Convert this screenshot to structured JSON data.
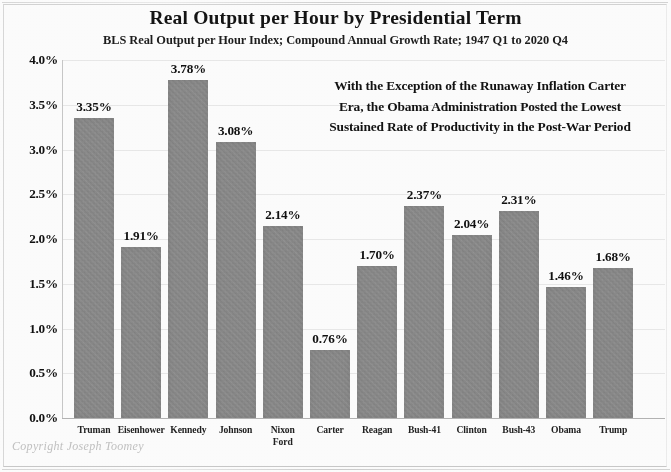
{
  "chart_data": {
    "type": "bar",
    "title": "Real Output per Hour by Presidential Term",
    "subtitle": "BLS Real Output per Hour Index; Compound Annual Growth Rate; 1947 Q1 to 2020 Q4",
    "xlabel": "",
    "ylabel": "",
    "ylim": [
      0,
      4.0
    ],
    "grid": true,
    "legend": "none",
    "categories": [
      "Truman",
      "Eisenhower",
      "Kennedy",
      "Johnson",
      "Nixon\nFord",
      "Carter",
      "Reagan",
      "Bush-41",
      "Clinton",
      "Bush-43",
      "Obama",
      "Trump"
    ],
    "values": [
      3.35,
      1.91,
      3.78,
      3.08,
      2.14,
      0.76,
      1.7,
      2.37,
      2.04,
      2.31,
      1.46,
      1.68
    ],
    "value_labels": [
      "3.35%",
      "1.91%",
      "3.78%",
      "3.08%",
      "2.14%",
      "0.76%",
      "1.70%",
      "2.37%",
      "2.04%",
      "2.31%",
      "1.46%",
      "1.68%"
    ],
    "ytick_labels": [
      "0.0%",
      "0.5%",
      "1.0%",
      "1.5%",
      "2.0%",
      "2.5%",
      "3.0%",
      "3.5%",
      "4.0%"
    ],
    "ytick_values": [
      0,
      0.5,
      1.0,
      1.5,
      2.0,
      2.5,
      3.0,
      3.5,
      4.0
    ],
    "bar_color": "#8b8b8b",
    "annotation": "With the Exception of the Runaway Inflation Carter Era, the Obama Administration Posted the Lowest Sustained Rate of Productivity in the Post-War Period"
  },
  "annotation_lines": [
    "With the Exception of the Runaway Inflation Carter",
    "Era, the Obama Administration Posted the Lowest",
    "Sustained Rate of Productivity in the Post-War Period"
  ],
  "category_labels": [
    {
      "line1": "Truman",
      "line2": ""
    },
    {
      "line1": "Eisenhower",
      "line2": ""
    },
    {
      "line1": "Kennedy",
      "line2": ""
    },
    {
      "line1": "Johnson",
      "line2": ""
    },
    {
      "line1": "Nixon",
      "line2": "Ford"
    },
    {
      "line1": "Carter",
      "line2": ""
    },
    {
      "line1": "Reagan",
      "line2": ""
    },
    {
      "line1": "Bush-41",
      "line2": ""
    },
    {
      "line1": "Clinton",
      "line2": ""
    },
    {
      "line1": "Bush-43",
      "line2": ""
    },
    {
      "line1": "Obama",
      "line2": ""
    },
    {
      "line1": "Trump",
      "line2": ""
    }
  ],
  "footer": {
    "copyright": "Copyright Joseph Toomey"
  }
}
